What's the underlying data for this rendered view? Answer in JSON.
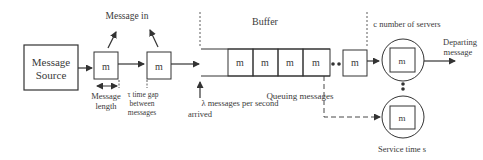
{
  "diagram": {
    "source": {
      "line1": "Message",
      "line2": "Source"
    },
    "message_glyph": "m",
    "labels": {
      "message_in": "Message in",
      "message_length_1": "Message",
      "message_length_2": "length",
      "time_gap_1": "τ time gap",
      "time_gap_2": "between",
      "time_gap_3": "messages",
      "arrival_1": "λ messages per second",
      "arrival_2": "arrived",
      "buffer": "Buffer",
      "queuing": "Queuing messages",
      "servers": "c number of servers",
      "departing_1": "Departing",
      "departing_2": "message",
      "service_time": "Service time s"
    },
    "colors": {
      "stroke": "#333333",
      "text": "#3a3a3a",
      "background": "#ffffff"
    }
  }
}
